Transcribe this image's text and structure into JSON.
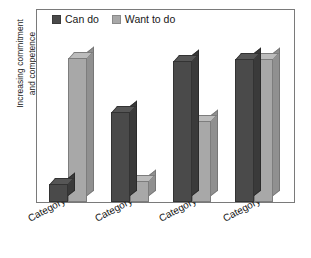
{
  "chart_data": {
    "type": "bar",
    "title": "",
    "subtitle": "",
    "xlabel": "",
    "ylabel": "Increasing commitment and competence",
    "ylabel_line1": "Increasing commitment",
    "ylabel_line2": "and competence",
    "categories": [
      "Category 1",
      "Category 2",
      "Category 3",
      "Category 4"
    ],
    "series": [
      {
        "name": "Can do",
        "color": "#4a4a4a",
        "values": [
          12,
          61,
          96,
          97
        ]
      },
      {
        "name": "Want to do",
        "color": "#a8a8a8",
        "values": [
          98,
          14,
          55,
          97
        ]
      }
    ],
    "ylim": [
      0,
      100
    ],
    "y_ticks": [],
    "grid": false,
    "legend_position": "top-left",
    "style": "3d-column",
    "axis_color": "#7a7a7a",
    "background": "#ffffff"
  },
  "legend": {
    "items": [
      {
        "label": "Can do",
        "swatch": "dark",
        "color": "#4a4a4a"
      },
      {
        "label": "Want to do",
        "swatch": "light",
        "color": "#a8a8a8"
      }
    ]
  },
  "axis": {
    "y_title_line1": "Increasing commitment",
    "y_title_line2": "and competence"
  },
  "x_labels": [
    "Category 1",
    "Category 2",
    "Category 3",
    "Category 4"
  ]
}
